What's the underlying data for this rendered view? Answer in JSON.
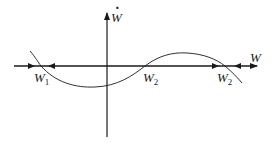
{
  "diagram": {
    "type": "phase-line",
    "axes": {
      "x_label": "W",
      "y_label": "Ẇ",
      "y_label_base": "W",
      "y_label_accent": "·"
    },
    "points": [
      {
        "name": "W",
        "subscript": "1",
        "x": 40,
        "stability": "stable"
      },
      {
        "name": "W",
        "subscript": "2",
        "x": 145,
        "stability": "unstable"
      },
      {
        "name": "W",
        "subscript": "2",
        "x": 225,
        "stability": "stable"
      }
    ],
    "curve_description": "cubic-like curve: positive left of W1, negative between W1 and W2, positive between W2 and right W2, negative beyond",
    "arrows": [
      {
        "x": 33,
        "direction": "right"
      },
      {
        "x": 48,
        "direction": "left"
      },
      {
        "x": 218,
        "direction": "right"
      },
      {
        "x": 234,
        "direction": "left"
      }
    ],
    "colors": {
      "stroke": "#1a1a1a",
      "background": "#ffffff"
    }
  }
}
